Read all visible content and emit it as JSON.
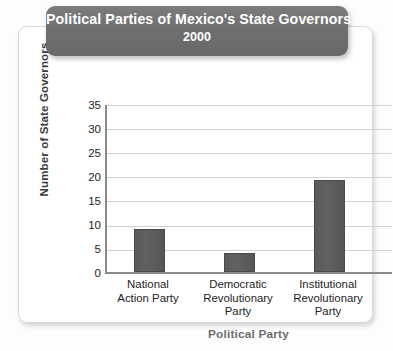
{
  "chart_data": {
    "type": "bar",
    "title": "Political Parties of Mexico's State Governors",
    "subtitle": "2000",
    "xlabel": "Political Party",
    "ylabel": "Number of State Governors",
    "categories": [
      "National Action Party",
      "Democratic Revolutionary Party",
      "Institutional Revolutionary Party"
    ],
    "category_lines": [
      [
        "National",
        "Action Party"
      ],
      [
        "Democratic",
        "Revolutionary",
        "Party"
      ],
      [
        "Institutional",
        "Revolutionary",
        "Party"
      ]
    ],
    "values": [
      9,
      4,
      19
    ],
    "ylim": [
      0,
      35
    ],
    "ytick_step": 5,
    "yticks": [
      "35",
      "30",
      "25",
      "20",
      "15",
      "10",
      "5",
      "0"
    ],
    "grid": true,
    "legend": "none",
    "bar_color": "#5d5d5d",
    "banner_color": "#6e6e6e",
    "gridline_color": "#d2d2d2",
    "axis_color": "#8a8a8a"
  }
}
